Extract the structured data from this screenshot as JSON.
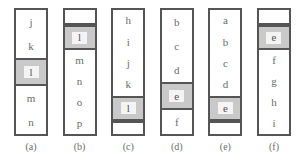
{
  "figure": {
    "colors": {
      "border": "#555555",
      "cell_background": "#ffffff",
      "highlight_background": "#c9c9c9",
      "highlight_glyph_background": "#f4f4f4",
      "text": "#6b6b6b",
      "page_background": "#ffffff"
    }
  },
  "columns": [
    {
      "caption": "(a)",
      "cells": [
        {
          "label": "j",
          "highlighted": false,
          "empty": false
        },
        {
          "label": "k",
          "highlighted": false,
          "empty": false
        },
        {
          "label": "l",
          "highlighted": true,
          "empty": false
        },
        {
          "label": "m",
          "highlighted": false,
          "empty": false
        },
        {
          "label": "n",
          "highlighted": false,
          "empty": false
        }
      ]
    },
    {
      "caption": "(b)",
      "cells": [
        {
          "label": "",
          "highlighted": false,
          "empty": true,
          "position": "top"
        },
        {
          "label": "l",
          "highlighted": true,
          "empty": false
        },
        {
          "label": "m",
          "highlighted": false,
          "empty": false
        },
        {
          "label": "n",
          "highlighted": false,
          "empty": false
        },
        {
          "label": "o",
          "highlighted": false,
          "empty": false
        },
        {
          "label": "p",
          "highlighted": false,
          "empty": false
        }
      ]
    },
    {
      "caption": "(c)",
      "cells": [
        {
          "label": "h",
          "highlighted": false,
          "empty": false
        },
        {
          "label": "i",
          "highlighted": false,
          "empty": false
        },
        {
          "label": "j",
          "highlighted": false,
          "empty": false
        },
        {
          "label": "k",
          "highlighted": false,
          "empty": false
        },
        {
          "label": "l",
          "highlighted": true,
          "empty": false
        },
        {
          "label": "",
          "highlighted": false,
          "empty": true,
          "position": "bottom"
        }
      ]
    },
    {
      "caption": "(d)",
      "cells": [
        {
          "label": "b",
          "highlighted": false,
          "empty": false
        },
        {
          "label": "c",
          "highlighted": false,
          "empty": false
        },
        {
          "label": "d",
          "highlighted": false,
          "empty": false
        },
        {
          "label": "e",
          "highlighted": true,
          "empty": false
        },
        {
          "label": "f",
          "highlighted": false,
          "empty": false
        }
      ]
    },
    {
      "caption": "(e)",
      "cells": [
        {
          "label": "a",
          "highlighted": false,
          "empty": false
        },
        {
          "label": "b",
          "highlighted": false,
          "empty": false
        },
        {
          "label": "c",
          "highlighted": false,
          "empty": false
        },
        {
          "label": "d",
          "highlighted": false,
          "empty": false
        },
        {
          "label": "e",
          "highlighted": true,
          "empty": false
        },
        {
          "label": "",
          "highlighted": false,
          "empty": true,
          "position": "bottom"
        }
      ]
    },
    {
      "caption": "(f)",
      "cells": [
        {
          "label": "",
          "highlighted": false,
          "empty": true,
          "position": "top"
        },
        {
          "label": "e",
          "highlighted": true,
          "empty": false
        },
        {
          "label": "f",
          "highlighted": false,
          "empty": false
        },
        {
          "label": "g",
          "highlighted": false,
          "empty": false
        },
        {
          "label": "h",
          "highlighted": false,
          "empty": false
        },
        {
          "label": "i",
          "highlighted": false,
          "empty": false
        }
      ]
    }
  ]
}
